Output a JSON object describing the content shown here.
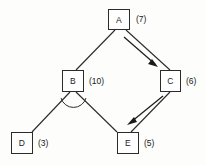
{
  "diagram": {
    "background_color": "#fdfdfc",
    "line_color": "#2b2b2b",
    "nodes": [
      {
        "id": "A",
        "label": "A",
        "weight": "(7)"
      },
      {
        "id": "B",
        "label": "B",
        "weight": "(10)"
      },
      {
        "id": "C",
        "label": "C",
        "weight": "(6)"
      },
      {
        "id": "D",
        "label": "D",
        "weight": "(3)"
      },
      {
        "id": "E",
        "label": "E",
        "weight": "(5)"
      }
    ],
    "edges": [
      {
        "from": "A",
        "to": "B",
        "style": "plain"
      },
      {
        "from": "A",
        "to": "C",
        "style": "plain"
      },
      {
        "from": "B",
        "to": "D",
        "style": "plain"
      },
      {
        "from": "B",
        "to": "E",
        "style": "plain"
      },
      {
        "from": "C",
        "to": "E",
        "style": "plain"
      }
    ],
    "arrows": [
      {
        "from": "A",
        "to": "C",
        "direction": "down-right"
      },
      {
        "from": "C",
        "to": "E",
        "direction": "down-left"
      }
    ],
    "angle_markers": [
      {
        "at": "B",
        "between": [
          "D",
          "E"
        ]
      }
    ]
  }
}
